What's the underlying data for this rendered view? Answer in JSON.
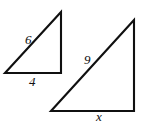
{
  "figure": {
    "background_color": "#ffffff",
    "stroke_color": "#101010",
    "label_color": "#111111",
    "shapes": [
      {
        "name": "small-triangle",
        "type": "right-triangle",
        "vertices": [
          [
            5,
            73
          ],
          [
            61,
            73
          ],
          [
            61,
            12
          ]
        ],
        "labels": {
          "hypotenuse": "6",
          "base": "4"
        }
      },
      {
        "name": "large-triangle",
        "type": "right-triangle",
        "vertices": [
          [
            51,
            111
          ],
          [
            134,
            111
          ],
          [
            134,
            20
          ]
        ],
        "labels": {
          "hypotenuse": "9",
          "base": "x"
        }
      }
    ],
    "labels": {
      "small_hypotenuse": "6",
      "small_base": "4",
      "large_hypotenuse": "9",
      "large_base": "x"
    }
  }
}
